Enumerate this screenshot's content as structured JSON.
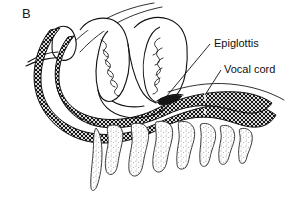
{
  "figure": {
    "panel_label": "B",
    "background_color": "#ffffff",
    "ink_color": "#111111",
    "type": "anatomical-line-drawing"
  },
  "callouts": [
    {
      "id": "epiglottis",
      "label": "Epiglottis",
      "label_x": 214,
      "label_y": 47,
      "leader_from_x": 210,
      "leader_from_y": 44,
      "leader_to_x": 166,
      "leader_to_y": 97
    },
    {
      "id": "vocal-cord",
      "label": "Vocal cord",
      "label_x": 224,
      "label_y": 73,
      "leader_from_x": 221,
      "leader_from_y": 70,
      "leader_to_x": 205,
      "leader_to_y": 95
    }
  ],
  "structures": [
    {
      "id": "soft-palate",
      "name": "soft palate"
    },
    {
      "id": "tongue-body",
      "name": "tongue body"
    },
    {
      "id": "posterior-pharyngeal-wall",
      "name": "posterior pharyngeal wall"
    },
    {
      "id": "airway-lumen",
      "name": "airway lumen"
    },
    {
      "id": "epiglottis-body",
      "name": "epiglottis"
    },
    {
      "id": "trachea-wall",
      "name": "trachea wall"
    },
    {
      "id": "cervical-vertebrae",
      "name": "cervical vertebrae"
    }
  ],
  "vertebrae": [
    {
      "index": 1,
      "x": 112
    },
    {
      "index": 2,
      "x": 137
    },
    {
      "index": 3,
      "x": 161
    },
    {
      "index": 4,
      "x": 184
    },
    {
      "index": 5,
      "x": 206
    },
    {
      "index": 6,
      "x": 226
    },
    {
      "index": 7,
      "x": 245
    }
  ]
}
